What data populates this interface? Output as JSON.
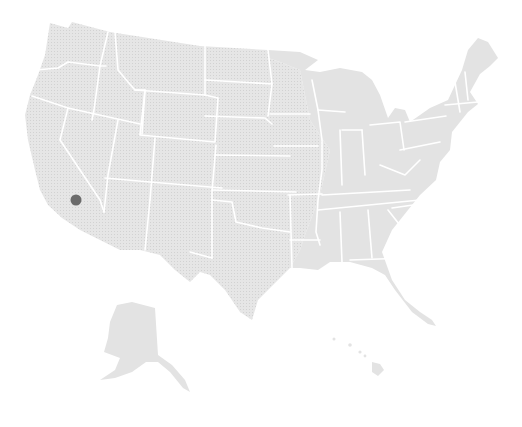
{
  "map": {
    "type": "choropleth-outline",
    "region": "United States",
    "colors": {
      "land": "#e3e3e3",
      "land_pattern": "#d6d6d6",
      "borders": "#ffffff",
      "background": "#ffffff",
      "marker": "#6b6b6b"
    },
    "markers": [
      {
        "label": "",
        "approx_location": "Southern California",
        "x": 76,
        "y": 200,
        "r": 5.5
      }
    ],
    "insets": [
      "Alaska",
      "Hawaii"
    ]
  }
}
